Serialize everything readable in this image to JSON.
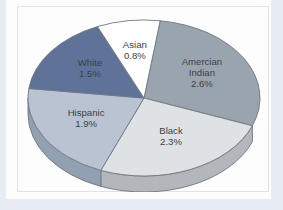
{
  "chart_data": {
    "type": "pie",
    "title": "",
    "subtitle": "",
    "xlabel": "",
    "ylabel": "",
    "legend": "none",
    "grid": false,
    "style": "3d-pie",
    "value_suffix": "%",
    "total": 9.1,
    "categories": [
      "Amercian Indian",
      "Black",
      "Hispanic",
      "White",
      "Asian"
    ],
    "values": [
      2.6,
      2.3,
      1.9,
      1.5,
      0.8
    ],
    "slices": [
      {
        "label": "Amercian Indian",
        "label_line1": "Amercian",
        "label_line2": "Indian",
        "value": 2.6,
        "value_text": "2.6%",
        "color": "#9aa4ae",
        "side_color": "#7b858f",
        "label_color": "#3b3f45"
      },
      {
        "label": "Black",
        "label_line1": "Black",
        "label_line2": "",
        "value": 2.3,
        "value_text": "2.3%",
        "color": "#dfe2e4",
        "side_color": "#b3b7bb",
        "label_color": "#3b3f45"
      },
      {
        "label": "Hispanic",
        "label_line1": "Hispanic",
        "label_line2": "",
        "value": 1.9,
        "value_text": "1.9%",
        "color": "#b9c3d2",
        "side_color": "#93a0b2",
        "label_color": "#3b3f45"
      },
      {
        "label": "White",
        "label_line1": "White",
        "label_line2": "",
        "value": 1.5,
        "value_text": "1.5%",
        "color": "#5f7398",
        "side_color": "#4a5c7d",
        "label_color": "#ffffff"
      },
      {
        "label": "Asian",
        "label_line1": "Asian",
        "label_line2": "",
        "value": 0.8,
        "value_text": "0.8%",
        "color": "#ffffff",
        "side_color": "#c8ccd2",
        "label_color": "#3b3f45"
      }
    ]
  },
  "colors": {
    "page_background": "#e8ecf4",
    "card_background": "#fdfdfd",
    "frame_border": "#dfe3e9",
    "outline": "#6e7782"
  }
}
